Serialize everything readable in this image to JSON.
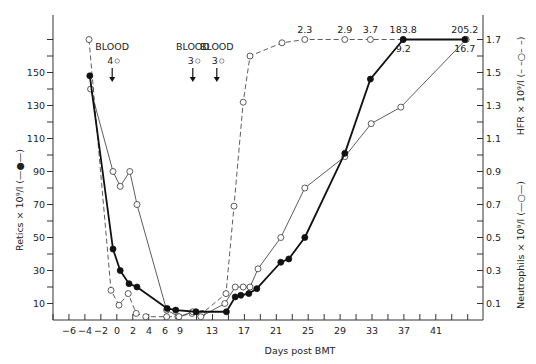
{
  "chart_data": {
    "type": "line",
    "title": "",
    "xlabel": "Days post BMT",
    "ylabel_left": "Retics × 10⁹/l (—●—)",
    "ylabel_right_upper": "HFR × 10⁹/l (– –○– –)",
    "ylabel_right_lower": "Neutrophils × 10⁹/l (—○—)",
    "x_tick_labels": [
      "−6",
      "−4",
      "−2",
      "0",
      "2",
      "4",
      "6",
      "9",
      "13",
      "17",
      "21",
      "25",
      "29",
      "33",
      "37",
      "41"
    ],
    "x_tick_days": [
      -6,
      -4,
      -2,
      0,
      2,
      4,
      6,
      9,
      13,
      17,
      21,
      25,
      29,
      33,
      37,
      41
    ],
    "left_ticks": [
      10,
      30,
      50,
      70,
      90,
      110,
      130,
      150
    ],
    "right_ticks": [
      0.1,
      0.3,
      0.5,
      0.7,
      0.9,
      1.1,
      1.3,
      1.5,
      1.7
    ],
    "ylim_left": [
      0,
      175
    ],
    "ylim_right": [
      0,
      1.75
    ],
    "grid": false,
    "series": [
      {
        "name": "Retics",
        "axis": "left",
        "style": "solid-thick-filled",
        "x": [
          -3.4,
          -0.5,
          0.4,
          1.5,
          2.5,
          6.6,
          8.2,
          11,
          14.8,
          15.9,
          16.6,
          17.6,
          18.6,
          21.6,
          22.6,
          24.6,
          29.6,
          32.8,
          36.9,
          44.6
        ],
        "values": [
          148,
          43,
          30,
          22,
          20,
          7,
          6,
          5,
          5,
          14,
          15,
          16,
          19,
          35,
          37,
          50,
          101,
          146,
          183.8,
          205.2
        ],
        "plotted_values": [
          148,
          43,
          30,
          22,
          20,
          7,
          6,
          5,
          5,
          14,
          15,
          16,
          19,
          35,
          37,
          50,
          101,
          146,
          170,
          170
        ]
      },
      {
        "name": "Neutrophils",
        "axis": "right",
        "style": "solid-thin-open",
        "x": [
          -3.3,
          -0.5,
          0.4,
          1.6,
          2.5,
          6.5,
          8.8,
          10.6,
          11.6,
          14.6,
          15.9,
          16.9,
          17.75,
          18.75,
          21.6,
          24.6,
          29.6,
          32.9,
          36.6,
          44.75
        ],
        "values": [
          1.4,
          0.9,
          0.81,
          0.9,
          0.7,
          0.06,
          0.02,
          0.05,
          0.02,
          0.1,
          0.2,
          0.2,
          0.2,
          0.31,
          0.5,
          0.8,
          0.99,
          1.19,
          1.29,
          16.7
        ],
        "plotted_values": [
          1.4,
          0.9,
          0.81,
          0.9,
          0.7,
          0.06,
          0.02,
          0.05,
          0.02,
          0.1,
          0.2,
          0.2,
          0.2,
          0.31,
          0.5,
          0.8,
          0.99,
          1.19,
          1.29,
          1.7
        ]
      },
      {
        "name": "HFR",
        "axis": "right",
        "style": "dashed-open",
        "x": [
          -3.5,
          -0.75,
          0.25,
          1.4,
          2.4,
          3.6,
          6.5,
          8.6,
          10.5,
          11.75,
          14.75,
          15.75,
          16.9,
          17.75,
          21.75,
          24.6,
          29.6,
          32.8,
          36.9,
          44.75
        ],
        "values": [
          1.7,
          0.18,
          0.09,
          0.16,
          0.04,
          0.02,
          0.02,
          0.02,
          0.04,
          0.04,
          0.16,
          0.69,
          1.32,
          1.6,
          1.68,
          2.3,
          2.9,
          3.7,
          1.7,
          1.7
        ],
        "plotted_values": [
          1.7,
          0.18,
          0.09,
          0.16,
          0.04,
          0.02,
          0.02,
          0.02,
          0.04,
          0.04,
          0.16,
          0.69,
          1.32,
          1.6,
          1.68,
          1.7,
          1.7,
          1.7,
          1.7,
          1.7
        ]
      }
    ],
    "annotations": [
      {
        "text": "BLOOD",
        "sub": "4",
        "day": -0.6,
        "type": "transfusion-arrow"
      },
      {
        "text": "BLOOD",
        "sub": "3",
        "day": 10.6,
        "type": "transfusion-arrow"
      },
      {
        "text": "BLOOD",
        "sub": "3",
        "day": 13.6,
        "type": "transfusion-arrow"
      }
    ],
    "value_labels": [
      {
        "text": "2.3",
        "series": "HFR",
        "day": 24.6,
        "pos": "above"
      },
      {
        "text": "2.9",
        "series": "HFR",
        "day": 29.6,
        "pos": "above"
      },
      {
        "text": "3.7",
        "series": "HFR",
        "day": 32.8,
        "pos": "above"
      },
      {
        "text": "183.8",
        "series": "Retics",
        "day": 36.9,
        "pos": "above"
      },
      {
        "text": "205.2",
        "series": "Retics",
        "day": 44.6,
        "pos": "above"
      },
      {
        "text": "9.2",
        "series": "HFR",
        "day": 36.9,
        "pos": "below"
      },
      {
        "text": "16.7",
        "series": "Neutrophils",
        "day": 44.6,
        "pos": "below"
      }
    ]
  }
}
